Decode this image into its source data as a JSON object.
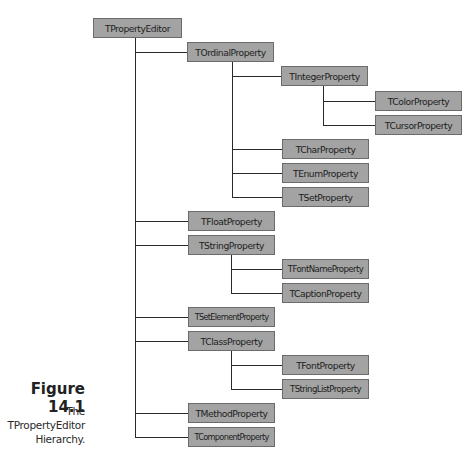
{
  "figure": {
    "label": "Figure 14.1",
    "description_lines": [
      "The",
      "TPropertyEditor",
      "Hierarchy."
    ]
  },
  "colors": {
    "node_fill": "#a3a3a3",
    "node_border": "#6b6b6b",
    "connector": "#2a2a2a"
  },
  "hierarchy": {
    "root": "TPropertyEditor",
    "nodes": [
      {
        "id": "n0",
        "label": "TPropertyEditor",
        "parent": null
      },
      {
        "id": "n1",
        "label": "TOrdinalProperty",
        "parent": "TPropertyEditor"
      },
      {
        "id": "n2",
        "label": "TIntegerProperty",
        "parent": "TOrdinalProperty"
      },
      {
        "id": "n3",
        "label": "TColorProperty",
        "parent": "TIntegerProperty"
      },
      {
        "id": "n4",
        "label": "TCursorProperty",
        "parent": "TIntegerProperty"
      },
      {
        "id": "n5",
        "label": "TCharProperty",
        "parent": "TOrdinalProperty"
      },
      {
        "id": "n6",
        "label": "TEnumProperty",
        "parent": "TOrdinalProperty"
      },
      {
        "id": "n7",
        "label": "TSetProperty",
        "parent": "TOrdinalProperty"
      },
      {
        "id": "n8",
        "label": "TFloatProperty",
        "parent": "TPropertyEditor"
      },
      {
        "id": "n9",
        "label": "TStringProperty",
        "parent": "TPropertyEditor"
      },
      {
        "id": "n10",
        "label": "TFontNameProperty",
        "parent": "TStringProperty"
      },
      {
        "id": "n11",
        "label": "TCaptionProperty",
        "parent": "TStringProperty"
      },
      {
        "id": "n12",
        "label": "TSetElementProperty",
        "parent": "TPropertyEditor"
      },
      {
        "id": "n13",
        "label": "TClassProperty",
        "parent": "TPropertyEditor"
      },
      {
        "id": "n14",
        "label": "TFontProperty",
        "parent": "TClassProperty"
      },
      {
        "id": "n15",
        "label": "TStringListProperty",
        "parent": "TClassProperty"
      },
      {
        "id": "n16",
        "label": "TMethodProperty",
        "parent": "TPropertyEditor"
      },
      {
        "id": "n17",
        "label": "TComponentProperty",
        "parent": "TPropertyEditor"
      }
    ]
  }
}
